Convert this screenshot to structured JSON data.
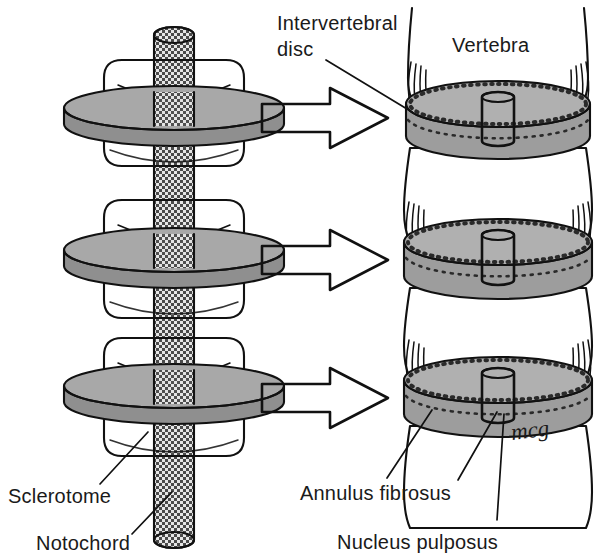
{
  "figure": {
    "signature": "mcg"
  },
  "colors": {
    "ink": "#111111",
    "paper": "#ffffff",
    "disc_gray": "#a8a8a8",
    "disc_gray_top": "#b4b4b4",
    "disc_gray_shadow": "#8f8f8f",
    "arrow_gray": "#9e9e9e",
    "notochord_gray": "#cfcfcf",
    "nucleus_gray": "#bdbdbd",
    "text": "#1a1a1a"
  },
  "labels": {
    "intervertebral_disc": {
      "line1": "Intervertebral",
      "line2": "disc",
      "x": 277,
      "y": 30
    },
    "vertebra": {
      "text": "Vertebra",
      "x": 452,
      "y": 52
    },
    "sclerotome": {
      "text": "Sclerotome",
      "x": 8,
      "y": 503
    },
    "notochord": {
      "text": "Notochord",
      "x": 36,
      "y": 550
    },
    "annulus_fibrosus": {
      "text": "Annulus fibrosus",
      "x": 300,
      "y": 500
    },
    "nucleus_pulposus": {
      "text": "Nucleus pulposus",
      "x": 337,
      "y": 549
    }
  },
  "left_column": {
    "name": "sclerotome-stack",
    "segment_count": 3,
    "segments": [
      {
        "index": 0,
        "cy": 120,
        "label": "sclerotome-segment-top"
      },
      {
        "index": 1,
        "cy": 265,
        "label": "sclerotome-segment-middle"
      },
      {
        "index": 2,
        "cy": 400,
        "label": "sclerotome-segment-bottom"
      }
    ],
    "notochord_label": "notochord-column"
  },
  "right_column": {
    "name": "vertebral-column",
    "disc_count": 3,
    "discs": [
      {
        "index": 0,
        "cy": 120,
        "label": "intervertebral-disc-top"
      },
      {
        "index": 1,
        "cy": 262,
        "label": "intervertebral-disc-middle"
      },
      {
        "index": 2,
        "cy": 400,
        "label": "intervertebral-disc-bottom"
      }
    ],
    "vertebrae": [
      {
        "index": 0,
        "label": "vertebra-top"
      },
      {
        "index": 1,
        "label": "vertebra-upper-middle"
      },
      {
        "index": 2,
        "label": "vertebra-lower-middle"
      },
      {
        "index": 3,
        "label": "vertebra-bottom"
      }
    ]
  },
  "arrows": [
    {
      "index": 0,
      "y": 118,
      "label": "transform-arrow-top"
    },
    {
      "index": 1,
      "y": 260,
      "label": "transform-arrow-middle"
    },
    {
      "index": 2,
      "y": 398,
      "label": "transform-arrow-bottom"
    }
  ]
}
